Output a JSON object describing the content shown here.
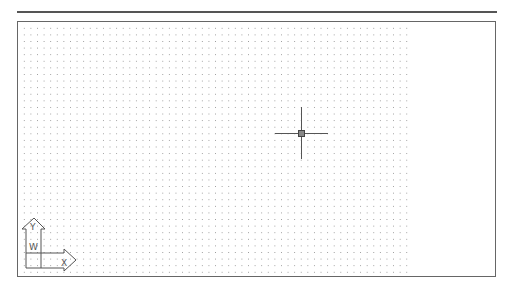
{
  "canvas": {
    "background": "#ffffff",
    "grid_color": "#9a9a9a",
    "border_color": "#666666"
  },
  "crosshair": {
    "icon": "crosshair-cursor-icon",
    "x": 301,
    "y": 133
  },
  "ucs_icon": {
    "icon": "ucs-axis-icon",
    "x_label": "X",
    "y_label": "Y",
    "w_label": "W"
  }
}
